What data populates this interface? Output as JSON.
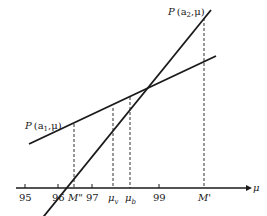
{
  "diagram": {
    "axis": {
      "label": "μ",
      "ticks": [
        {
          "label": "95",
          "x": 25
        },
        {
          "label": "96",
          "x": 58
        },
        {
          "label": "97",
          "x": 92
        },
        {
          "label": "99",
          "x": 159
        }
      ],
      "markers": [
        {
          "label": "M\"",
          "x": 74
        },
        {
          "label": "μ",
          "sub": "v",
          "x": 113
        },
        {
          "label": "μ",
          "sub": "b",
          "x": 130
        },
        {
          "label": "M'",
          "x": 204
        }
      ]
    },
    "lines": [
      {
        "name": "P(a1,μ)",
        "label_main": "P",
        "label_args": "(a",
        "label_sub": "1",
        "label_tail": ",μ)"
      },
      {
        "name": "P(a2,μ)",
        "label_main": "P",
        "label_args": "(a",
        "label_sub": "2",
        "label_tail": ",μ)"
      }
    ],
    "colors": {
      "ink": "#1a1a1a",
      "background": "#ffffff"
    }
  }
}
